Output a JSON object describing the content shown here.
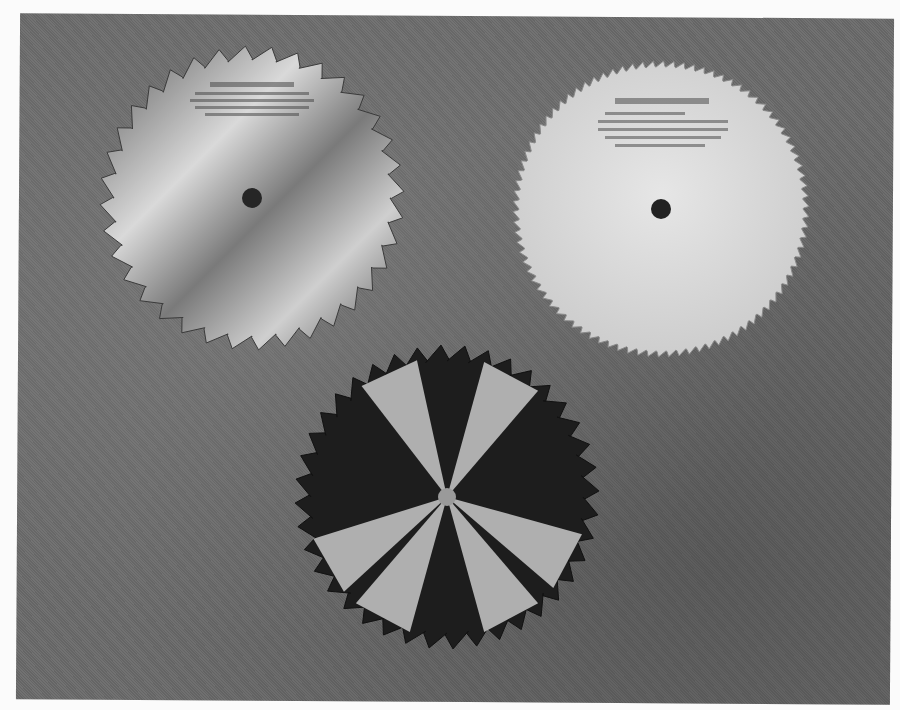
{
  "image": {
    "description": "Grayscale halftone photograph of three circular saw blades on a mottled gray background",
    "background_color": "#6a6a6a",
    "page_color": "#fbfbfb"
  },
  "blades": [
    {
      "name": "combination-blade",
      "position": "top-left",
      "cx": 252,
      "cy": 198,
      "r": 152,
      "teeth": 36,
      "style": "large hooked teeth with gullets, light metallic",
      "label_text": ""
    },
    {
      "name": "fine-tooth-blade",
      "position": "top-right",
      "cx": 661,
      "cy": 209,
      "r": 148,
      "teeth": 90,
      "style": "fine small teeth, bright plain plate",
      "label_text": ""
    },
    {
      "name": "dado-style-blade",
      "position": "bottom-center",
      "cx": 447,
      "cy": 497,
      "r": 152,
      "teeth": 40,
      "style": "dark plate with light radial reflection bands",
      "label_text": ""
    }
  ]
}
